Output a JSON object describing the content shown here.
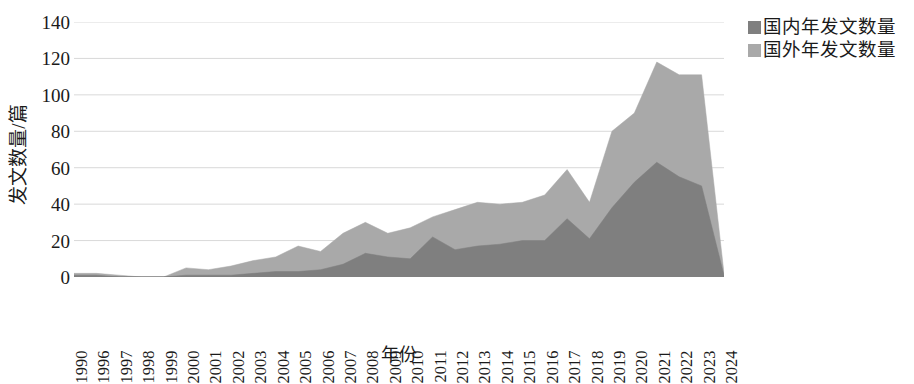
{
  "chart_data": {
    "type": "area",
    "stacked": true,
    "title": "",
    "xlabel": "年份",
    "ylabel": "发文数量/篇",
    "ylim": [
      0,
      140
    ],
    "ytick_step": 20,
    "yticks": [
      0,
      20,
      40,
      60,
      80,
      100,
      120,
      140
    ],
    "grid": true,
    "grid_axis": "y",
    "legend_position": "top-right",
    "categories": [
      "1990",
      "1996",
      "1997",
      "1998",
      "1999",
      "2000",
      "2001",
      "2002",
      "2003",
      "2004",
      "2005",
      "2006",
      "2007",
      "2008",
      "2009",
      "2010",
      "2011",
      "2012",
      "2013",
      "2014",
      "2015",
      "2016",
      "2017",
      "2018",
      "2019",
      "2020",
      "2021",
      "2022",
      "2023",
      "2024"
    ],
    "series": [
      {
        "name": "国内年发文数量",
        "color": "#7f7f7f",
        "values": [
          1,
          1,
          0,
          0,
          0,
          1,
          1,
          1,
          2,
          3,
          3,
          4,
          7,
          13,
          11,
          10,
          22,
          15,
          17,
          18,
          20,
          20,
          32,
          21,
          38,
          52,
          63,
          55,
          50,
          1
        ]
      },
      {
        "name": "国外年发文数量",
        "color": "#a9a9a9",
        "values": [
          1,
          1,
          1,
          0,
          0,
          4,
          3,
          5,
          7,
          8,
          14,
          10,
          17,
          17,
          13,
          17,
          11,
          22,
          24,
          22,
          21,
          25,
          27,
          20,
          42,
          38,
          55,
          56,
          61,
          1
        ]
      }
    ],
    "totals": [
      2,
      2,
      1,
      0,
      0,
      5,
      4,
      6,
      9,
      11,
      17,
      14,
      24,
      30,
      24,
      27,
      33,
      37,
      41,
      40,
      41,
      45,
      59,
      41,
      80,
      90,
      118,
      111,
      111,
      2
    ]
  },
  "legend": {
    "items": [
      {
        "label": "国内年发文数量",
        "color": "#7f7f7f"
      },
      {
        "label": "国外年发文数量",
        "color": "#a9a9a9"
      }
    ]
  },
  "axes": {
    "y_title": "发文数量/篇",
    "x_title": "年份"
  },
  "colors": {
    "domestic": "#7f7f7f",
    "foreign": "#a9a9a9",
    "grid": "#d9d9d9",
    "axis": "#808080",
    "text": "#1a1a1a",
    "background": "#ffffff"
  }
}
